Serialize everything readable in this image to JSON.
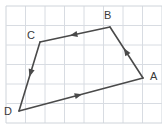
{
  "figure": {
    "name": "quadrilateral-vector-diagram",
    "width": 162,
    "height": 132,
    "background_color": "#ffffff",
    "grid": {
      "line_color": "#d8dce2",
      "border_color": "#cfd4da",
      "cell_size": 19.5,
      "origin_x": 6,
      "origin_y": 6,
      "columns": 8,
      "rows": 6,
      "visible": true
    },
    "shape": {
      "type": "closed-polygon",
      "stroke_color": "#4a4a4a",
      "stroke_width": 1.6,
      "fill": "none",
      "vertices": [
        {
          "label": "A",
          "x": 143,
          "y": 78,
          "label_x": 150,
          "label_y": 71
        },
        {
          "label": "B",
          "x": 110,
          "y": 27,
          "label_x": 104,
          "label_y": 10
        },
        {
          "label": "C",
          "x": 40,
          "y": 42,
          "label_x": 27,
          "label_y": 30
        },
        {
          "label": "D",
          "x": 19,
          "y": 111,
          "label_x": 4,
          "label_y": 106
        }
      ],
      "edges": [
        {
          "name": "edge-D-A",
          "from": "D",
          "to": "A",
          "arrow_position": 0.48,
          "arrow_direction": "toward-A"
        },
        {
          "name": "edge-A-B",
          "from": "A",
          "to": "B",
          "arrow_position": 0.52,
          "arrow_direction": "toward-B"
        },
        {
          "name": "edge-B-C",
          "from": "B",
          "to": "C",
          "arrow_position": 0.52,
          "arrow_direction": "toward-C"
        },
        {
          "name": "edge-C-D",
          "from": "C",
          "to": "D",
          "arrow_position": 0.45,
          "arrow_direction": "toward-D"
        }
      ]
    }
  }
}
